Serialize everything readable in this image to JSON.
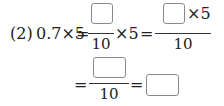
{
  "problem": {
    "label": "(2)",
    "row1": {
      "lhs": "0.7×5",
      "eq1": "=",
      "frac1": {
        "numerator": "",
        "denominator": "10"
      },
      "times_five": "×5",
      "eq2": "=",
      "frac2": {
        "numerator_suffix": "×5",
        "denominator": "10"
      }
    },
    "row2": {
      "eq1": "=",
      "frac3": {
        "numerator": "",
        "denominator": "10"
      },
      "eq2": "=",
      "answer": ""
    }
  }
}
